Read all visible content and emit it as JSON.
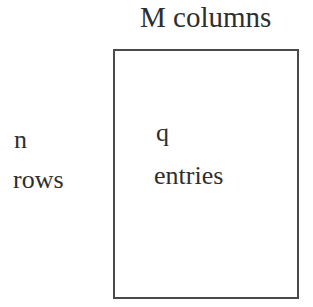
{
  "diagram": {
    "column_label": "M columns",
    "row_count_symbol": "n",
    "row_label": "rows",
    "entry_count_symbol": "q",
    "entry_label": "entries"
  },
  "colors": {
    "text": "#2e2e2e",
    "border": "#4a4a4a",
    "background": "#ffffff"
  }
}
